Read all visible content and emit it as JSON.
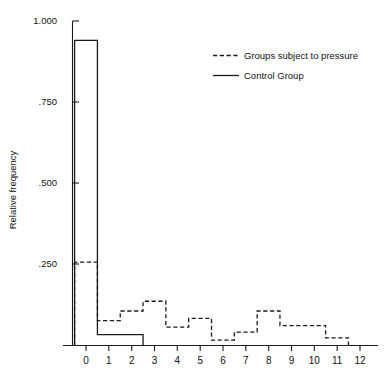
{
  "chart_data": {
    "type": "bar",
    "title": "",
    "subtitle": "",
    "xlabel": "",
    "ylabel": "Relative frequency",
    "xlim": [
      -0.5,
      12.5
    ],
    "ylim": [
      0,
      1.0
    ],
    "grid": false,
    "legend_position": "top-right",
    "x_tick_labels": [
      "0",
      "1",
      "2",
      "3",
      "4",
      "5",
      "6",
      "7",
      "8",
      "9",
      "10",
      "11",
      "12"
    ],
    "x_tick_values": [
      0,
      1,
      2,
      3,
      4,
      5,
      6,
      7,
      8,
      9,
      10,
      11,
      12
    ],
    "y_tick_labels": [
      "1.000",
      ".750",
      ".500",
      ".250"
    ],
    "y_tick_values": [
      1.0,
      0.75,
      0.5,
      0.25
    ],
    "categories": [
      0,
      1,
      2,
      3,
      4,
      5,
      6,
      7,
      8,
      9,
      10,
      11
    ],
    "bin_width": 1,
    "series": [
      {
        "name": "Groups subject to pressure",
        "style": "dashed",
        "color": "#1a1a1a",
        "values": [
          0.256,
          0.075,
          0.105,
          0.135,
          0.055,
          0.082,
          0.015,
          0.04,
          0.105,
          0.06,
          0.06,
          0.022
        ]
      },
      {
        "name": "Control Group",
        "style": "solid",
        "color": "#1a1a1a",
        "values": [
          0.94,
          0.032,
          0.032,
          0,
          0,
          0,
          0,
          0,
          0,
          0,
          0,
          0
        ]
      }
    ],
    "legend": [
      {
        "label": "Groups subject to pressure",
        "style": "dashed"
      },
      {
        "label": "Control Group",
        "style": "solid"
      }
    ]
  },
  "axes": {
    "y_axis_name": "y-axis",
    "x_axis_name": "x-axis"
  }
}
